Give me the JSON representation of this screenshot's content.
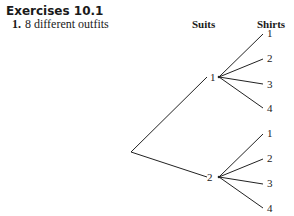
{
  "heading": "Exercises 10.1",
  "exercise": {
    "number": "1.",
    "answer": "8 different outfits"
  },
  "tree": {
    "headers": {
      "suits": "Suits",
      "shirts": "Shirts"
    },
    "suits": [
      {
        "label": "1",
        "shirts": [
          "1",
          "2",
          "3",
          "4"
        ]
      },
      {
        "label": "2",
        "shirts": [
          "1",
          "2",
          "3",
          "4"
        ]
      }
    ]
  }
}
